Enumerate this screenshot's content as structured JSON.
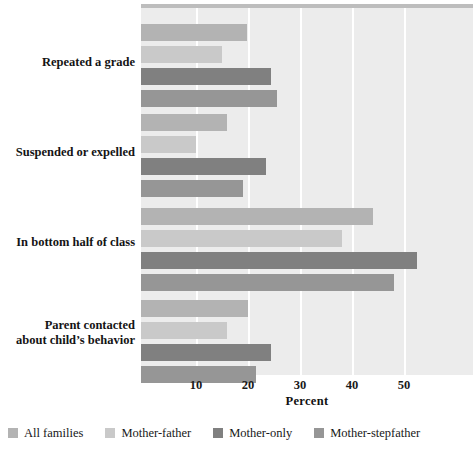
{
  "chart_data": {
    "type": "bar",
    "orientation": "horizontal",
    "title": "",
    "xlabel": "Percent",
    "ylabel": "",
    "xlim": [
      0,
      64
    ],
    "xticks": [
      10,
      20,
      30,
      40,
      50
    ],
    "grid": true,
    "legend_position": "bottom",
    "categories": [
      "Repeated a grade",
      "Suspended or expelled",
      "In bottom half of class",
      "Parent contacted about child's behavior"
    ],
    "category_lines": [
      [
        "Repeated a grade"
      ],
      [
        "Suspended or expelled"
      ],
      [
        "In bottom half of class"
      ],
      [
        "Parent contacted",
        "about child’s behavior"
      ]
    ],
    "series": [
      {
        "name": "All families",
        "color": "#b3b3b3",
        "values": [
          19.8,
          16.0,
          44.0,
          20.0
        ]
      },
      {
        "name": "Mother-father",
        "color": "#c9c9c9",
        "values": [
          15.0,
          10.0,
          38.0,
          16.0
        ]
      },
      {
        "name": "Mother-only",
        "color": "#808080",
        "values": [
          24.5,
          23.5,
          52.5,
          24.5
        ]
      },
      {
        "name": "Mother-stepfather",
        "color": "#969696",
        "values": [
          25.5,
          19.0,
          48.0,
          21.5
        ]
      }
    ]
  },
  "axis": {
    "tick_labels": [
      "10",
      "20",
      "30",
      "40",
      "50"
    ],
    "x_axis_title": "Percent"
  },
  "legend": {
    "items": [
      {
        "label": "All families",
        "color": "#b3b3b3"
      },
      {
        "label": "Mother-father",
        "color": "#c9c9c9"
      },
      {
        "label": "Mother-only",
        "color": "#808080"
      },
      {
        "label": "Mother-stepfather",
        "color": "#969696"
      }
    ]
  },
  "colors": {
    "plot_background": "#ececec",
    "gridline": "#ffffff",
    "page_background": "#ffffff",
    "top_band": "#bdbdbd",
    "label_text": "#141414"
  }
}
